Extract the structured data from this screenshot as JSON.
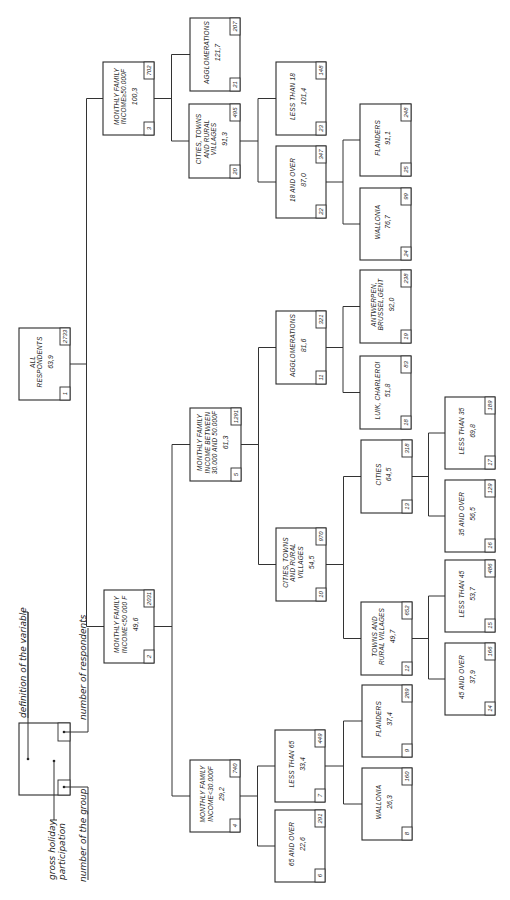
{
  "legend": {
    "definition": "definition of the variable",
    "respondents": "number of respondents",
    "participation_line1": "gross holiday",
    "participation_line2": "participation",
    "group": "number of the group"
  },
  "nodes": {
    "n1": {
      "group": "1",
      "lines": [
        "ALL",
        "RESPONDENTS"
      ],
      "value": "63,9",
      "respondents": "2733"
    },
    "n2": {
      "group": "2",
      "lines": [
        "MONTHLY FAMILY",
        "INCOME<50 000 F"
      ],
      "value": "49,6",
      "respondents": "2031"
    },
    "n3": {
      "group": "3",
      "lines": [
        "MONTHLY FAMILY",
        "INCOME≥50.000F"
      ],
      "value": "100,3",
      "respondents": "702"
    },
    "n4": {
      "group": "4",
      "lines": [
        "MONTHLY FAMILY",
        "INCOME<30.000F"
      ],
      "value": "29,2",
      "respondents": "740"
    },
    "n5": {
      "group": "5",
      "lines": [
        "MONTHLY FAMILY",
        "INCOME BETWEEN",
        "30.000 AND 50.000F"
      ],
      "value": "61,3",
      "respondents": "1291"
    },
    "n6": {
      "group": "6",
      "lines": [
        "65 AND OVER"
      ],
      "value": "22,6",
      "respondents": "291"
    },
    "n7": {
      "group": "7",
      "lines": [
        "LESS THAN 65"
      ],
      "value": "33,4",
      "respondents": "449"
    },
    "n8": {
      "group": "8",
      "lines": [
        "WALLONIA"
      ],
      "value": "26,3",
      "respondents": "160"
    },
    "n9": {
      "group": "9",
      "lines": [
        "FLANDERS"
      ],
      "value": "37,4",
      "respondents": "289"
    },
    "n10": {
      "group": "10",
      "lines": [
        "CITIES, TOWNS",
        "AND RURAL",
        "VILLAGES"
      ],
      "value": "54,5",
      "respondents": "970"
    },
    "n11": {
      "group": "11",
      "lines": [
        "AGGLOMERATIONS"
      ],
      "value": "81,6",
      "respondents": "321"
    },
    "n12": {
      "group": "12",
      "lines": [
        "TOWNS AND",
        "RURAL VILLAGES"
      ],
      "value": "49,7",
      "respondents": "652"
    },
    "n13": {
      "group": "13",
      "lines": [
        "CITIES"
      ],
      "value": "64,5",
      "respondents": "318"
    },
    "n14": {
      "group": "14",
      "lines": [
        "45 AND OVER"
      ],
      "value": "37,9",
      "respondents": "166"
    },
    "n15": {
      "group": "15",
      "lines": [
        "LESS THAN 45"
      ],
      "value": "53,7",
      "respondents": "486"
    },
    "n16": {
      "group": "16",
      "lines": [
        "35 AND OVER"
      ],
      "value": "56,5",
      "respondents": "129"
    },
    "n17": {
      "group": "17",
      "lines": [
        "LESS THAN 35"
      ],
      "value": "69,8",
      "respondents": "189"
    },
    "n18": {
      "group": "18",
      "lines": [
        "LUIK, CHARLEROI"
      ],
      "value": "51,8",
      "respondents": "83"
    },
    "n19": {
      "group": "19",
      "lines": [
        "ANTWERPEN,",
        "BRUSSEL,GENT"
      ],
      "value": "92,0",
      "respondents": "238"
    },
    "n20": {
      "group": "20",
      "lines": [
        "CITIES, TOWNS",
        "AND RURAL",
        "VILLAGES"
      ],
      "value": "91,3",
      "respondents": "495"
    },
    "n21": {
      "group": "21",
      "lines": [
        "AGGLOMERATIONS"
      ],
      "value": "121,7",
      "respondents": "207"
    },
    "n22": {
      "group": "22",
      "lines": [
        "18 AND OVER"
      ],
      "value": "87,0",
      "respondents": "347"
    },
    "n23": {
      "group": "23",
      "lines": [
        "LESS THAN 18"
      ],
      "value": "101,4",
      "respondents": "148"
    },
    "n24": {
      "group": "24",
      "lines": [
        "WALLONIA"
      ],
      "value": "76,7",
      "respondents": "99"
    },
    "n25": {
      "group": "25",
      "lines": [
        "FLANDERS"
      ],
      "value": "91,1",
      "respondents": "248"
    }
  }
}
